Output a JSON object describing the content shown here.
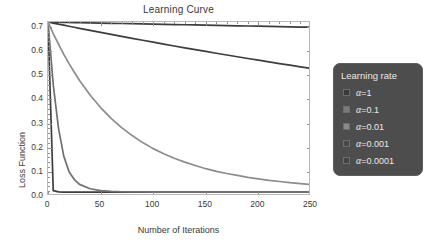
{
  "chart_data": {
    "type": "line",
    "title": "Learning Curve",
    "xlabel": "Number of Iterations",
    "ylabel": "Loss Function",
    "xlim": [
      0,
      250
    ],
    "ylim": [
      0.0,
      0.72
    ],
    "xticks": [
      0,
      50,
      100,
      150,
      200,
      250
    ],
    "xtick_labels": [
      "0",
      "50",
      "100",
      "150",
      "200",
      "250"
    ],
    "yticks": [
      0.0,
      0.1,
      0.2,
      0.3,
      0.4,
      0.5,
      0.6,
      0.7
    ],
    "ytick_labels": [
      "0.0",
      "0.1",
      "0.2",
      "0.3",
      "0.4",
      "0.5",
      "0.6",
      "0.7"
    ],
    "grid": false,
    "minor_ticks": true,
    "legend_position": "right-outside",
    "legend_title": "Learning rate",
    "x": [
      0,
      5,
      10,
      15,
      20,
      25,
      30,
      40,
      50,
      60,
      70,
      80,
      90,
      100,
      110,
      120,
      130,
      140,
      150,
      160,
      170,
      180,
      190,
      200,
      210,
      220,
      230,
      240,
      250
    ],
    "series": [
      {
        "name": "α=1",
        "label": "α=1",
        "color": "#3d3d3d",
        "swatch_color": "#3a3a3a",
        "values": [
          0.72,
          0.022,
          0.017,
          0.016,
          0.016,
          0.016,
          0.016,
          0.016,
          0.016,
          0.016,
          0.016,
          0.016,
          0.016,
          0.016,
          0.016,
          0.016,
          0.016,
          0.016,
          0.016,
          0.016,
          0.016,
          0.016,
          0.016,
          0.016,
          0.016,
          0.016,
          0.016,
          0.016,
          0.016
        ]
      },
      {
        "name": "α=0.1",
        "label": "α=0.1",
        "color": "#707070",
        "swatch_color": "#7a7a7a",
        "values": [
          0.72,
          0.46,
          0.28,
          0.165,
          0.1,
          0.068,
          0.048,
          0.03,
          0.022,
          0.019,
          0.0175,
          0.017,
          0.0165,
          0.016,
          0.016,
          0.016,
          0.016,
          0.016,
          0.016,
          0.016,
          0.016,
          0.016,
          0.016,
          0.016,
          0.016,
          0.016,
          0.016,
          0.016,
          0.016
        ]
      },
      {
        "name": "α=0.01",
        "label": "α=0.01",
        "color": "#8c8c8c",
        "swatch_color": "#8a8a8a",
        "values": [
          0.72,
          0.672,
          0.628,
          0.586,
          0.548,
          0.512,
          0.478,
          0.418,
          0.366,
          0.321,
          0.283,
          0.25,
          0.221,
          0.196,
          0.175,
          0.156,
          0.14,
          0.126,
          0.113,
          0.102,
          0.093,
          0.085,
          0.077,
          0.071,
          0.065,
          0.06,
          0.055,
          0.051,
          0.047
        ]
      },
      {
        "name": "α=0.001",
        "label": "α=0.001",
        "color": "#3d3d3d",
        "swatch_color": "#4a4a4a",
        "values": [
          0.72,
          0.7156,
          0.7112,
          0.7068,
          0.7025,
          0.6982,
          0.6939,
          0.6854,
          0.677,
          0.6687,
          0.6605,
          0.6524,
          0.6444,
          0.6364,
          0.6286,
          0.6208,
          0.6132,
          0.6056,
          0.5981,
          0.5907,
          0.5834,
          0.5761,
          0.569,
          0.5619,
          0.5549,
          0.548,
          0.5412,
          0.5344,
          0.5277
        ]
      },
      {
        "name": "α=0.0001",
        "label": "α=0.0001",
        "color": "#3d3d3d",
        "swatch_color": "#444444",
        "values": [
          0.72,
          0.7196,
          0.7191,
          0.7187,
          0.7182,
          0.7178,
          0.7173,
          0.7165,
          0.7156,
          0.7147,
          0.7138,
          0.713,
          0.7121,
          0.7112,
          0.7103,
          0.7095,
          0.7086,
          0.7077,
          0.7069,
          0.706,
          0.7052,
          0.7043,
          0.7035,
          0.7026,
          0.7018,
          0.7009,
          0.7001,
          0.6992,
          0.6984
        ]
      }
    ]
  },
  "legend": {
    "title": "Learning rate",
    "entries": [
      {
        "label": "α=1"
      },
      {
        "label": "α=0.1"
      },
      {
        "label": "α=0.01"
      },
      {
        "label": "α=0.001"
      },
      {
        "label": "α=0.0001"
      }
    ]
  },
  "colors": {
    "frame": "#b9b9b9",
    "tick": "#8f8f8f",
    "text": "#3a3a3a",
    "legend_bg": "#4d4d4d",
    "legend_text": "#eaeaea"
  }
}
